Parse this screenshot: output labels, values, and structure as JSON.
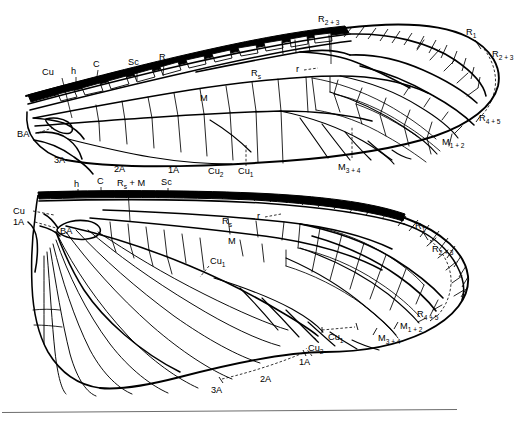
{
  "figure": {
    "background_color": "#ffffff",
    "ink_color": "#000000",
    "rule_color": "#6d6d6d"
  },
  "forewing": {
    "name": "forewing",
    "labels": {
      "cu": "Cu",
      "h": "h",
      "c": "C",
      "sc": "Sc",
      "r": "R",
      "ba": "BA",
      "a3": "3A",
      "a2": "2A",
      "a1": "1A",
      "cu2": "Cu",
      "cu2_sub": "2",
      "cu1": "Cu",
      "cu1_sub": "1",
      "m": "M",
      "rs": "R",
      "rs_sub": "s",
      "r_cross": "r",
      "r23_top": "R",
      "r23_top_sub": "2 + 3",
      "r1": "R",
      "r1_sub": "1",
      "r23": "R",
      "r23_sub": "2 + 3",
      "r45": "R",
      "r45_sub": "4 + 5",
      "m12": "M",
      "m12_sub": "1 + 2",
      "m34": "M",
      "m34_sub": "3 + 4"
    }
  },
  "hindwing": {
    "name": "hindwing",
    "labels": {
      "h": "h",
      "c": "C",
      "rsm": "R",
      "rsm_sub": "s",
      "rsm_tail": " + M",
      "sc": "Sc",
      "cu": "Cu",
      "a1_base": "1A",
      "ba": "BA",
      "rs": "R",
      "rs_sub": "s",
      "r_cross": "r",
      "m": "M",
      "cu1_mid": "Cu",
      "cu1_mid_sub": "1",
      "r1": "R",
      "r1_sub": "1",
      "r23": "R",
      "r23_sub": "2 + 3",
      "r45": "R",
      "r45_sub": "4 + 5",
      "m12": "M",
      "m12_sub": "1 + 2",
      "m34": "M",
      "m34_sub": "3 + 4",
      "cu1": "Cu",
      "cu1_sub": "1",
      "cu2": "Cu",
      "cu2_sub": "2",
      "a1": "1A",
      "a2": "2A",
      "a3": "3A"
    }
  }
}
